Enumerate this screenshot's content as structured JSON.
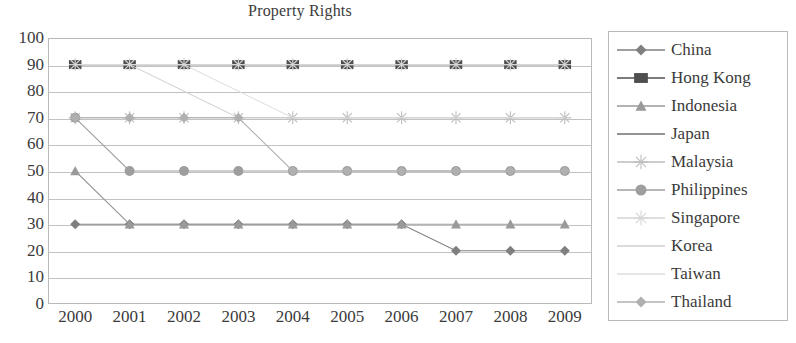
{
  "chart_data": {
    "type": "line",
    "title": "Property Rights",
    "xlabel": "",
    "ylabel": "",
    "x": [
      "2000",
      "2001",
      "2002",
      "2003",
      "2004",
      "2005",
      "2006",
      "2007",
      "2008",
      "2009"
    ],
    "ylim": [
      0,
      100
    ],
    "ytick_step": 10,
    "yticks": [
      "100",
      "90",
      "80",
      "70",
      "60",
      "50",
      "40",
      "30",
      "20",
      "10",
      "0"
    ],
    "grid": true,
    "legend_position": "right",
    "series": [
      {
        "name": "China",
        "marker": "diamond",
        "color": "#7f7f7f",
        "values": [
          30,
          30,
          30,
          30,
          30,
          30,
          30,
          20,
          20,
          20
        ]
      },
      {
        "name": "Hong Kong",
        "marker": "square",
        "color": "#4f4f4f",
        "values": [
          90,
          90,
          90,
          90,
          90,
          90,
          90,
          90,
          90,
          90
        ]
      },
      {
        "name": "Indonesia",
        "marker": "triangle",
        "color": "#9a9a9a",
        "values": [
          50,
          30,
          30,
          30,
          30,
          30,
          30,
          30,
          30,
          30
        ]
      },
      {
        "name": "Japan",
        "marker": "none",
        "color": "#6f6f6f",
        "values": [
          90,
          90,
          90,
          90,
          90,
          90,
          90,
          90,
          90,
          90
        ]
      },
      {
        "name": "Malaysia",
        "marker": "star",
        "color": "#bdbdbd",
        "values": [
          70,
          70,
          70,
          70,
          70,
          70,
          70,
          70,
          70,
          70
        ]
      },
      {
        "name": "Philippines",
        "marker": "circle",
        "color": "#9e9e9e",
        "values": [
          70,
          50,
          50,
          50,
          50,
          50,
          50,
          50,
          50,
          50
        ]
      },
      {
        "name": "Singapore",
        "marker": "plus",
        "color": "#d5d5d5",
        "values": [
          90,
          90,
          90,
          90,
          90,
          90,
          90,
          90,
          90,
          90
        ]
      },
      {
        "name": "Korea",
        "marker": "none",
        "color": "#cfcfcf",
        "values": [
          90,
          90,
          80,
          70,
          70,
          70,
          70,
          70,
          70,
          70
        ]
      },
      {
        "name": "Taiwan",
        "marker": "none",
        "color": "#dcdcdc",
        "values": [
          90,
          90,
          90,
          80,
          70,
          70,
          70,
          70,
          70,
          70
        ]
      },
      {
        "name": "Thailand",
        "marker": "diamond",
        "color": "#b0b0b0",
        "values": [
          70,
          70,
          70,
          70,
          50,
          50,
          50,
          50,
          50,
          50
        ]
      }
    ]
  },
  "legend": {
    "items": [
      {
        "label": "China"
      },
      {
        "label": "Hong Kong"
      },
      {
        "label": "Indonesia"
      },
      {
        "label": "Japan"
      },
      {
        "label": "Malaysia"
      },
      {
        "label": "Philippines"
      },
      {
        "label": "Singapore"
      },
      {
        "label": "Korea"
      },
      {
        "label": "Taiwan"
      },
      {
        "label": "Thailand"
      }
    ]
  },
  "colors": {
    "axis": "#b9b9b9",
    "grid": "#c2c2c2",
    "text": "#3b3b3b",
    "background": "#ffffff"
  }
}
